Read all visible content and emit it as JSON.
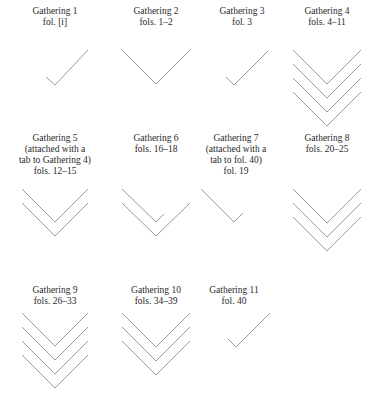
{
  "line_color": "#9a9a9a",
  "text_color": "#2a2a2a",
  "gatherings": [
    {
      "name": "Gathering 1",
      "lines": [
        "Gathering 1",
        "fol. [i]"
      ],
      "bifolia": 0,
      "singletons": [
        {
          "type": "right-conjugate"
        }
      ]
    },
    {
      "name": "Gathering 2",
      "lines": [
        "Gathering 2",
        "fols. 1–2"
      ],
      "bifolia": 1,
      "singletons": []
    },
    {
      "name": "Gathering 3",
      "lines": [
        "Gathering 3",
        "fol. 3"
      ],
      "bifolia": 0,
      "singletons": [
        {
          "type": "right-conjugate"
        }
      ]
    },
    {
      "name": "Gathering 4",
      "lines": [
        "Gathering 4",
        "fols. 4–11"
      ],
      "bifolia": 4,
      "singletons": []
    },
    {
      "name": "Gathering 5",
      "lines": [
        "Gathering 5",
        "(attached with a",
        "tab to Gathering 4)",
        "fols. 12–15"
      ],
      "bifolia": 2,
      "singletons": []
    },
    {
      "name": "Gathering 6",
      "lines": [
        "Gathering 6",
        "fols. 16–18"
      ],
      "bifolia": 1,
      "singletons": [
        {
          "type": "left-conjugate"
        }
      ]
    },
    {
      "name": "Gathering 7",
      "lines": [
        "Gathering 7",
        "(attached with a",
        "tab to fol. 40)",
        "fol. 19"
      ],
      "bifolia": 0,
      "singletons": [
        {
          "type": "left-conjugate"
        }
      ]
    },
    {
      "name": "Gathering 8",
      "lines": [
        "Gathering 8",
        "fols. 20–25"
      ],
      "bifolia": 3,
      "singletons": []
    },
    {
      "name": "Gathering 9",
      "lines": [
        "Gathering 9",
        "fols. 26–33"
      ],
      "bifolia": 4,
      "singletons": []
    },
    {
      "name": "Gathering 10",
      "lines": [
        "Gathering 10",
        "fols. 34–39"
      ],
      "bifolia": 3,
      "singletons": []
    },
    {
      "name": "Gathering 11",
      "lines": [
        "Gathering 11",
        "fol. 40"
      ],
      "bifolia": 0,
      "singletons": [
        {
          "type": "right-conjugate"
        }
      ]
    }
  ]
}
